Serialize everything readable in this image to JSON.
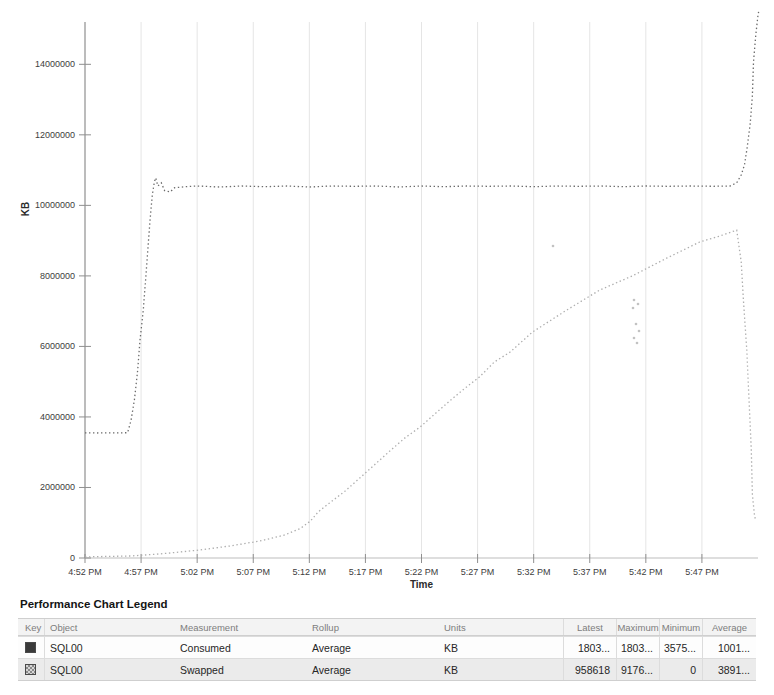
{
  "chart_data": {
    "type": "line",
    "title": "",
    "xlabel": "Time",
    "ylabel": "KB",
    "grid": "vertical",
    "legend_position": "bottom-table",
    "legend_entries": [
      "SQL00 Consumed",
      "SQL00 Swapped"
    ],
    "x_range_minutes": [
      0,
      60
    ],
    "ylim": [
      0,
      15200000
    ],
    "y_ticks": [
      {
        "value": 0,
        "label": "0"
      },
      {
        "value": 2000000,
        "label": "2000000"
      },
      {
        "value": 4000000,
        "label": "4000000"
      },
      {
        "value": 6000000,
        "label": "6000000"
      },
      {
        "value": 8000000,
        "label": "8000000"
      },
      {
        "value": 10000000,
        "label": "10000000"
      },
      {
        "value": 12000000,
        "label": "12000000"
      },
      {
        "value": 14000000,
        "label": "14000000"
      }
    ],
    "x_ticks": [
      {
        "min": 0,
        "label": "4:52 PM"
      },
      {
        "min": 5,
        "label": "4:57 PM"
      },
      {
        "min": 10,
        "label": "5:02 PM"
      },
      {
        "min": 15,
        "label": "5:07 PM"
      },
      {
        "min": 20,
        "label": "5:12 PM"
      },
      {
        "min": 25,
        "label": "5:17 PM"
      },
      {
        "min": 30,
        "label": "5:22 PM"
      },
      {
        "min": 35,
        "label": "5:27 PM"
      },
      {
        "min": 40,
        "label": "5:32 PM"
      },
      {
        "min": 45,
        "label": "5:37 PM"
      },
      {
        "min": 50,
        "label": "5:42 PM"
      },
      {
        "min": 55,
        "label": "5:47 PM"
      }
    ],
    "series": [
      {
        "name": "Consumed",
        "object": "SQL00",
        "color": "#6b6b6b",
        "style": "dotted",
        "points": [
          [
            0,
            3550000
          ],
          [
            1,
            3545000
          ],
          [
            2,
            3550000
          ],
          [
            3,
            3548000
          ],
          [
            3.8,
            3552000
          ],
          [
            4.1,
            3900000
          ],
          [
            4.4,
            4480000
          ],
          [
            4.7,
            5330000
          ],
          [
            4.9,
            6180000
          ],
          [
            5.2,
            7030000
          ],
          [
            5.4,
            7890000
          ],
          [
            5.6,
            8740000
          ],
          [
            5.8,
            9590000
          ],
          [
            6.0,
            10300000
          ],
          [
            6.2,
            10680000
          ],
          [
            6.3,
            10780000
          ],
          [
            6.5,
            10550000
          ],
          [
            6.8,
            10640000
          ],
          [
            7.1,
            10420000
          ],
          [
            7.6,
            10380000
          ],
          [
            8.0,
            10500000
          ],
          [
            9,
            10530000
          ],
          [
            10,
            10550000
          ],
          [
            12,
            10520000
          ],
          [
            14,
            10550000
          ],
          [
            16,
            10530000
          ],
          [
            18,
            10550000
          ],
          [
            20,
            10520000
          ],
          [
            22,
            10550000
          ],
          [
            24,
            10540000
          ],
          [
            26,
            10550000
          ],
          [
            28,
            10520000
          ],
          [
            30,
            10550000
          ],
          [
            32,
            10530000
          ],
          [
            34,
            10550000
          ],
          [
            36,
            10540000
          ],
          [
            38,
            10550000
          ],
          [
            40,
            10530000
          ],
          [
            42,
            10550000
          ],
          [
            44,
            10540000
          ],
          [
            46,
            10550000
          ],
          [
            48,
            10530000
          ],
          [
            50,
            10550000
          ],
          [
            52,
            10540000
          ],
          [
            54,
            10550000
          ],
          [
            56,
            10540000
          ],
          [
            57.5,
            10550000
          ],
          [
            58.1,
            10640000
          ],
          [
            58.5,
            10860000
          ],
          [
            58.8,
            11150000
          ],
          [
            59.0,
            11570000
          ],
          [
            59.3,
            12280000
          ],
          [
            59.5,
            13130000
          ],
          [
            59.6,
            14070000
          ],
          [
            59.8,
            14830000
          ],
          [
            60.0,
            15400000
          ],
          [
            60.1,
            15550000
          ]
        ]
      },
      {
        "name": "Swapped",
        "object": "SQL00",
        "color": "#adadad",
        "style": "dotted",
        "points": [
          [
            0,
            30000
          ],
          [
            2,
            45000
          ],
          [
            4,
            57000
          ],
          [
            6,
            100000
          ],
          [
            7.6,
            142000
          ],
          [
            10.2,
            227000
          ],
          [
            12.9,
            340000
          ],
          [
            15.6,
            482000
          ],
          [
            17.8,
            652000
          ],
          [
            19.2,
            840000
          ],
          [
            20.1,
            1050000
          ],
          [
            20.8,
            1310000
          ],
          [
            21.8,
            1560000
          ],
          [
            23.2,
            1900000
          ],
          [
            24.5,
            2270000
          ],
          [
            25.8,
            2640000
          ],
          [
            27.2,
            3040000
          ],
          [
            28.5,
            3400000
          ],
          [
            29.9,
            3720000
          ],
          [
            31.2,
            4090000
          ],
          [
            32.5,
            4450000
          ],
          [
            33.9,
            4820000
          ],
          [
            35.2,
            5140000
          ],
          [
            36.5,
            5560000
          ],
          [
            37.9,
            5840000
          ],
          [
            39.9,
            6410000
          ],
          [
            43.0,
            7040000
          ],
          [
            45.9,
            7600000
          ],
          [
            48.8,
            8000000
          ],
          [
            51.9,
            8510000
          ],
          [
            54.8,
            8960000
          ],
          [
            56.6,
            9130000
          ],
          [
            58.1,
            9300000
          ],
          [
            58.5,
            8400000
          ],
          [
            58.7,
            7320000
          ],
          [
            59.0,
            5900000
          ],
          [
            59.2,
            4480000
          ],
          [
            59.4,
            3060000
          ],
          [
            59.5,
            1790000
          ],
          [
            59.7,
            1190000
          ],
          [
            59.8,
            1060000
          ]
        ]
      }
    ],
    "scan_marks_px": [
      [
        634,
        300
      ],
      [
        638,
        304
      ],
      [
        633,
        308
      ],
      [
        636,
        324
      ],
      [
        639,
        331
      ],
      [
        634,
        338
      ],
      [
        637,
        343
      ],
      [
        553,
        246
      ]
    ]
  },
  "legend": {
    "title": "Performance Chart Legend",
    "columns": [
      "Key",
      "Object",
      "Measurement",
      "Rollup",
      "Units",
      "Latest",
      "Maximum",
      "Minimum",
      "Average"
    ],
    "rows": [
      {
        "key_color": "#3a3a3a",
        "key_style": "solid",
        "object": "SQL00",
        "measurement": "Consumed",
        "rollup": "Average",
        "units": "KB",
        "latest": "1803...",
        "maximum": "1803...",
        "minimum": "3575...",
        "average": "1001..."
      },
      {
        "key_color": "#8a8a8a",
        "key_style": "checkered",
        "object": "SQL00",
        "measurement": "Swapped",
        "rollup": "Average",
        "units": "KB",
        "latest": "958618",
        "maximum": "9176...",
        "minimum": "0",
        "average": "3891..."
      }
    ]
  }
}
